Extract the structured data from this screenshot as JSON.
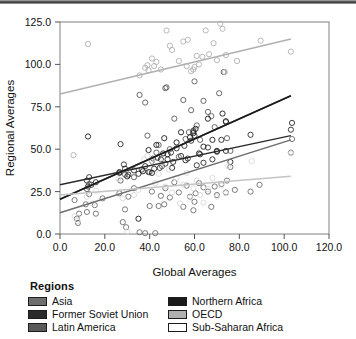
{
  "figure": {
    "top_bar_color": "#4a4a4a",
    "background": "#ffffff"
  },
  "axes": {
    "x_title": "Global Averages",
    "y_title": "Regional Averages",
    "x_ticks": [
      "0.0",
      "20.0",
      "40.0",
      "60.0",
      "80.0",
      "100.0",
      "120.0"
    ],
    "y_ticks": [
      "0.0",
      "25.0",
      "50.0",
      "75.0",
      "100.0",
      "125.0"
    ]
  },
  "legend": {
    "title": "Regions",
    "items": [
      {
        "label": "Asia",
        "color": "#6e6e6e",
        "column": "left"
      },
      {
        "label": "Former Soviet Union",
        "color": "#2b2b2b",
        "column": "left"
      },
      {
        "label": "Latin America",
        "color": "#5a5a5a",
        "column": "left"
      },
      {
        "label": "Northern Africa",
        "color": "#1a1a1a",
        "column": "right"
      },
      {
        "label": "OECD",
        "color": "#b0b0b0",
        "column": "right"
      },
      {
        "label": "Sub-Saharan Africa",
        "color": "#ffffff",
        "column": "right"
      }
    ]
  },
  "chart_data": {
    "type": "scatter",
    "title": "",
    "xlabel": "Global Averages",
    "ylabel": "Regional Averages",
    "xlim": [
      0,
      120
    ],
    "ylim": [
      0,
      125
    ],
    "grid": false,
    "legend_position": "below-plot",
    "marker": "open-circle",
    "series": [
      {
        "name": "Asia",
        "color": "#6e6e6e",
        "trendline": {
          "x0": 0,
          "y0": 12.5,
          "x1": 103,
          "y1": 55.5
        },
        "points": [
          [
            6.5,
            20.0
          ],
          [
            7.5,
            9.0
          ],
          [
            8.0,
            6.5
          ],
          [
            8.5,
            12.0
          ],
          [
            11.5,
            17.5
          ],
          [
            12.0,
            13.0
          ],
          [
            13.0,
            23.5
          ],
          [
            15.5,
            17.0
          ],
          [
            16.0,
            12.0
          ],
          [
            19.0,
            21.0
          ],
          [
            26.5,
            24.0
          ],
          [
            28.0,
            7.0
          ],
          [
            29.0,
            14.5
          ],
          [
            29.5,
            4.0
          ],
          [
            30.5,
            22.0
          ],
          [
            33.0,
            27.0
          ],
          [
            35.5,
            1.0
          ],
          [
            38.0,
            0.5
          ],
          [
            40.0,
            16.5
          ],
          [
            41.0,
            25.0
          ],
          [
            42.5,
            0.5
          ],
          [
            44.0,
            16.5
          ],
          [
            45.0,
            22.5
          ],
          [
            46.5,
            17.5
          ],
          [
            47.0,
            27.0
          ],
          [
            49.0,
            21.5
          ],
          [
            51.0,
            30.5
          ],
          [
            53.0,
            24.5
          ],
          [
            55.0,
            16.0
          ],
          [
            56.5,
            28.5
          ],
          [
            58.0,
            22.0
          ],
          [
            59.5,
            14.0
          ],
          [
            60.0,
            19.0
          ],
          [
            60.5,
            24.0
          ],
          [
            62.0,
            30.0
          ],
          [
            64.0,
            27.5
          ],
          [
            66.0,
            25.0
          ],
          [
            67.5,
            16.0
          ],
          [
            69.0,
            28.0
          ],
          [
            70.0,
            23.0
          ],
          [
            72.0,
            29.5
          ],
          [
            74.0,
            24.5
          ],
          [
            74.5,
            31.5
          ],
          [
            76.0,
            39.5
          ],
          [
            78.0,
            26.0
          ],
          [
            85.0,
            25.0
          ],
          [
            89.0,
            29.0
          ],
          [
            103.0,
            48.0
          ],
          [
            103.5,
            56.0
          ]
        ]
      },
      {
        "name": "Former Soviet Union",
        "color": "#2b2b2b",
        "trendline": {
          "x0": 0,
          "y0": 29.0,
          "x1": 103,
          "y1": 58.0
        },
        "points": [
          [
            12.0,
            31.5
          ],
          [
            12.5,
            28.0
          ],
          [
            13.0,
            33.5
          ],
          [
            14.0,
            29.0
          ],
          [
            16.0,
            30.5
          ],
          [
            26.5,
            36.0
          ],
          [
            27.0,
            53.0
          ],
          [
            28.5,
            41.0
          ],
          [
            29.0,
            38.5
          ],
          [
            30.5,
            35.0
          ],
          [
            33.0,
            37.5
          ],
          [
            35.0,
            35.5
          ],
          [
            36.5,
            38.0
          ],
          [
            38.0,
            40.0
          ],
          [
            39.5,
            36.5
          ],
          [
            41.0,
            43.0
          ],
          [
            42.0,
            38.5
          ],
          [
            43.5,
            45.0
          ],
          [
            44.5,
            39.0
          ],
          [
            46.0,
            47.5
          ],
          [
            47.0,
            41.5
          ],
          [
            48.0,
            44.0
          ],
          [
            49.5,
            48.0
          ],
          [
            50.5,
            42.5
          ],
          [
            52.0,
            50.5
          ],
          [
            54.0,
            46.0
          ],
          [
            55.5,
            52.0
          ],
          [
            57.0,
            44.5
          ],
          [
            58.5,
            55.0
          ],
          [
            59.5,
            60.5
          ],
          [
            60.0,
            58.0
          ],
          [
            61.0,
            40.5
          ],
          [
            62.5,
            47.0
          ],
          [
            64.0,
            42.0
          ],
          [
            66.0,
            51.0
          ],
          [
            68.0,
            44.0
          ],
          [
            70.0,
            48.5
          ],
          [
            72.0,
            55.5
          ],
          [
            74.0,
            49.0
          ],
          [
            76.0,
            42.5
          ],
          [
            85.0,
            58.5
          ],
          [
            103.0,
            61.5
          ],
          [
            103.5,
            65.5
          ]
        ]
      },
      {
        "name": "Latin America",
        "color": "#5a5a5a",
        "trendline": {
          "x0": 0,
          "y0": 20.5,
          "x1": 103,
          "y1": 81.5
        },
        "points": [
          [
            12.0,
            26.5
          ],
          [
            13.0,
            29.5
          ],
          [
            27.0,
            31.5
          ],
          [
            29.0,
            35.0
          ],
          [
            33.0,
            33.5
          ],
          [
            35.5,
            82.0
          ],
          [
            38.0,
            77.5
          ],
          [
            39.0,
            58.0
          ],
          [
            40.0,
            36.5
          ],
          [
            41.5,
            44.5
          ],
          [
            43.0,
            48.0
          ],
          [
            44.0,
            52.5
          ],
          [
            45.5,
            40.0
          ],
          [
            47.0,
            86.0
          ],
          [
            47.5,
            86.5
          ],
          [
            49.0,
            50.0
          ],
          [
            51.0,
            68.0
          ],
          [
            53.0,
            45.5
          ],
          [
            55.0,
            79.0
          ],
          [
            56.0,
            56.0
          ],
          [
            57.5,
            60.0
          ],
          [
            58.5,
            73.0
          ],
          [
            59.5,
            61.0
          ],
          [
            60.0,
            90.0
          ],
          [
            61.0,
            64.0
          ],
          [
            62.5,
            55.5
          ],
          [
            64.0,
            78.5
          ],
          [
            66.0,
            72.0
          ],
          [
            67.5,
            69.5
          ],
          [
            69.0,
            63.0
          ],
          [
            71.0,
            83.0
          ],
          [
            73.0,
            95.5
          ],
          [
            74.0,
            66.0
          ],
          [
            74.5,
            56.5
          ],
          [
            76.0,
            49.0
          ]
        ]
      },
      {
        "name": "Northern Africa",
        "color": "#1a1a1a",
        "trendline": {
          "x0": 0,
          "y0": 20.5,
          "x1": 103,
          "y1": 81.5
        },
        "points": [
          [
            12.5,
            57.5
          ],
          [
            26.5,
            36.5
          ],
          [
            30.0,
            34.0
          ],
          [
            35.0,
            9.0
          ],
          [
            37.0,
            37.0
          ],
          [
            39.5,
            49.5
          ],
          [
            41.0,
            36.0
          ],
          [
            43.0,
            52.5
          ],
          [
            45.0,
            44.0
          ],
          [
            46.5,
            56.5
          ],
          [
            48.0,
            47.0
          ],
          [
            50.0,
            39.0
          ],
          [
            52.0,
            54.0
          ],
          [
            54.0,
            60.0
          ],
          [
            56.0,
            43.5
          ],
          [
            58.0,
            57.0
          ],
          [
            59.5,
            59.5
          ],
          [
            60.5,
            62.0
          ],
          [
            62.0,
            47.5
          ],
          [
            64.0,
            51.5
          ],
          [
            66.0,
            68.0
          ],
          [
            68.0,
            55.5
          ],
          [
            70.0,
            49.0
          ],
          [
            72.5,
            71.0
          ],
          [
            74.0,
            66.5
          ]
        ]
      },
      {
        "name": "OECD",
        "color": "#b0b0b0",
        "trendline": {
          "x0": 0,
          "y0": 82.5,
          "x1": 103,
          "y1": 115.0
        },
        "points": [
          [
            6.0,
            46.5
          ],
          [
            12.5,
            112.0
          ],
          [
            35.5,
            93.5
          ],
          [
            38.0,
            98.0
          ],
          [
            39.0,
            99.5
          ],
          [
            39.5,
            96.5
          ],
          [
            41.0,
            103.5
          ],
          [
            42.0,
            99.0
          ],
          [
            43.0,
            101.5
          ],
          [
            45.0,
            97.0
          ],
          [
            47.5,
            120.0
          ],
          [
            49.0,
            111.0
          ],
          [
            50.0,
            108.5
          ],
          [
            53.0,
            102.0
          ],
          [
            55.0,
            113.5
          ],
          [
            56.5,
            99.0
          ],
          [
            57.0,
            114.5
          ],
          [
            58.5,
            96.0
          ],
          [
            59.5,
            97.0
          ],
          [
            60.0,
            98.5
          ],
          [
            61.0,
            105.0
          ],
          [
            62.0,
            100.0
          ],
          [
            63.5,
            104.5
          ],
          [
            65.0,
            120.0
          ],
          [
            66.5,
            106.0
          ],
          [
            68.5,
            112.5
          ],
          [
            70.0,
            102.5
          ],
          [
            71.5,
            124.0
          ],
          [
            72.5,
            121.0
          ],
          [
            73.5,
            95.5
          ],
          [
            74.0,
            105.5
          ],
          [
            79.0,
            102.0
          ],
          [
            89.5,
            114.0
          ],
          [
            103.0,
            107.5
          ]
        ]
      },
      {
        "name": "Sub-Saharan Africa",
        "color": "#d8d8d8",
        "trendline": {
          "x0": 0,
          "y0": 23.0,
          "x1": 103,
          "y1": 34.0
        },
        "points": [
          [
            6.5,
            10.5
          ],
          [
            8.0,
            7.5
          ],
          [
            12.0,
            22.0
          ],
          [
            14.5,
            18.0
          ],
          [
            16.0,
            25.5
          ],
          [
            26.0,
            32.5
          ],
          [
            28.0,
            21.0
          ],
          [
            30.0,
            1.5
          ],
          [
            33.0,
            23.0
          ],
          [
            35.0,
            26.0
          ],
          [
            37.5,
            44.0
          ],
          [
            39.0,
            46.0
          ],
          [
            41.0,
            43.0
          ],
          [
            42.5,
            30.0
          ],
          [
            44.0,
            35.5
          ],
          [
            45.5,
            42.0
          ],
          [
            47.0,
            28.0
          ],
          [
            48.5,
            38.0
          ],
          [
            50.0,
            24.5
          ],
          [
            52.0,
            33.0
          ],
          [
            53.5,
            18.0
          ],
          [
            55.0,
            29.0
          ],
          [
            56.5,
            36.0
          ],
          [
            58.0,
            21.5
          ],
          [
            59.5,
            27.0
          ],
          [
            61.0,
            31.5
          ],
          [
            62.5,
            23.0
          ],
          [
            64.0,
            18.5
          ],
          [
            66.0,
            26.5
          ],
          [
            68.0,
            33.0
          ],
          [
            70.0,
            22.0
          ],
          [
            72.0,
            28.5
          ],
          [
            74.0,
            24.0
          ],
          [
            75.0,
            40.0
          ],
          [
            85.5,
            43.0
          ],
          [
            103.0,
            47.5
          ]
        ]
      }
    ]
  }
}
